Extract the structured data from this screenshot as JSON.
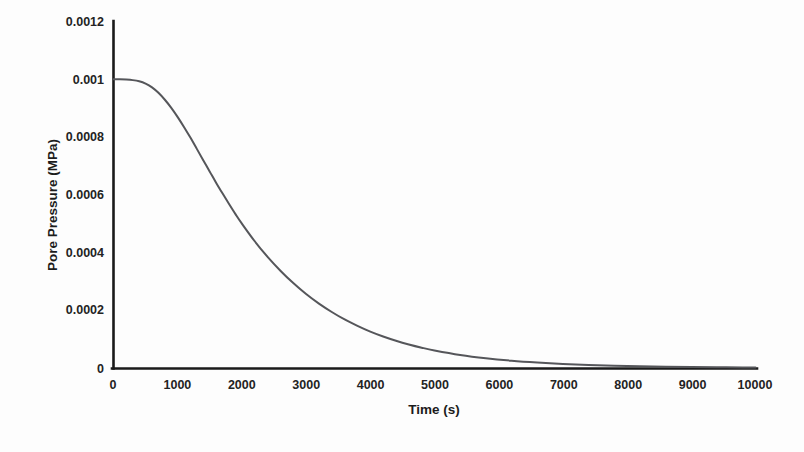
{
  "chart_data": {
    "type": "line",
    "title": "",
    "subtitle": "",
    "xlabel": "Time (s)",
    "ylabel": "Pore Pressure  (MPa)",
    "xlim": [
      0,
      10000
    ],
    "ylim": [
      0,
      0.0012
    ],
    "grid": false,
    "legend": null,
    "legend_position": "none",
    "xticks": [
      0,
      1000,
      2000,
      3000,
      4000,
      5000,
      6000,
      7000,
      8000,
      9000,
      10000
    ],
    "xtick_labels": [
      "0",
      "1000",
      "2000",
      "3000",
      "4000",
      "5000",
      "6000",
      "7000",
      "8000",
      "9000",
      "10000"
    ],
    "yticks": [
      0,
      0.0002,
      0.0004,
      0.0006,
      0.0008,
      0.001,
      0.0012
    ],
    "ytick_labels": [
      "0",
      "0.0002",
      "0.0004",
      "0.0006",
      "0.0008",
      "0.001",
      "0.0012"
    ],
    "series": [
      {
        "name": "Pore pressure dissipation",
        "color": "#55565a",
        "x": [
          0,
          100,
          200,
          300,
          400,
          500,
          600,
          700,
          800,
          900,
          1000,
          1100,
          1200,
          1300,
          1400,
          1500,
          1600,
          1700,
          1800,
          1900,
          2000,
          2200,
          2400,
          2600,
          2800,
          3000,
          3200,
          3400,
          3600,
          3800,
          4000,
          4200,
          4400,
          4600,
          4800,
          5000,
          5400,
          5800,
          6200,
          6600,
          7000,
          7400,
          7800,
          8200,
          8600,
          9000,
          9400,
          9800,
          10000
        ],
        "y": [
          0.001,
          0.001,
          0.000999,
          0.000997,
          0.000993,
          0.000985,
          0.000972,
          0.000953,
          0.000929,
          0.000901,
          0.000869,
          0.000834,
          0.000797,
          0.000758,
          0.000719,
          0.00068,
          0.000641,
          0.000604,
          0.000568,
          0.000533,
          0.0005,
          0.000439,
          0.000385,
          0.000337,
          0.000294,
          0.000256,
          0.000223,
          0.000194,
          0.000168,
          0.000146,
          0.000126,
          0.000109,
          9.43e-05,
          8.15e-05,
          7.04e-05,
          6.08e-05,
          4.53e-05,
          3.38e-05,
          2.52e-05,
          1.88e-05,
          1.4e-05,
          1.04e-05,
          7.8e-06,
          5.8e-06,
          4.3e-06,
          3.2e-06,
          2.4e-06,
          1.8e-06,
          1.5e-06
        ]
      }
    ]
  },
  "axes": {
    "x_title": "Time (s)",
    "y_title": "Pore Pressure  (MPa)"
  },
  "colors": {
    "curve": "#55565a",
    "axis": "#1a1a1a",
    "text": "#232323",
    "background": "#fdfdfd"
  }
}
